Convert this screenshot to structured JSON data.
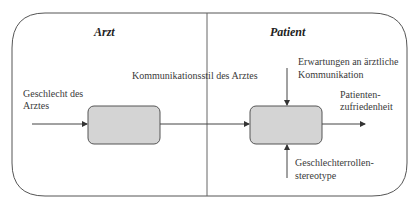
{
  "sections": {
    "left_title": "Arzt",
    "right_title": "Patient"
  },
  "labels": {
    "input": [
      "Geschlecht des",
      "Arztes"
    ],
    "middle": "Kommunikationsstil des Arztes",
    "top_input": [
      "Erwartungen an ärztliche",
      "Kommunikation"
    ],
    "output": [
      "Patienten-",
      "zufriedenheit"
    ],
    "bottom_input": [
      "Geschlechterrollen-",
      "stereotype"
    ]
  },
  "colors": {
    "box_fill": "#d4d4d4",
    "line": "#444444"
  }
}
